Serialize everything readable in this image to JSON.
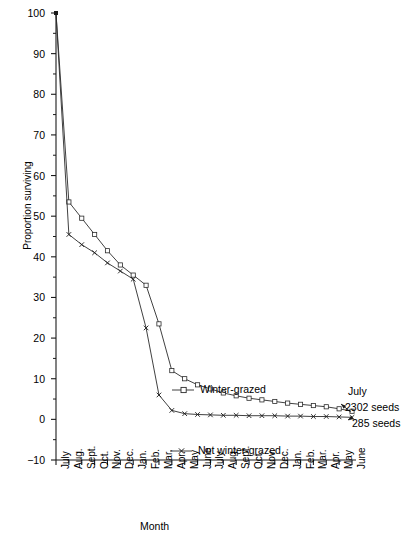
{
  "chart_data": {
    "type": "line",
    "title": "",
    "xlabel": "Month",
    "ylabel": "Proportion surviving",
    "ylim": [
      -10,
      100
    ],
    "yticks": [
      100,
      90,
      80,
      70,
      60,
      50,
      40,
      30,
      20,
      10,
      0,
      -10
    ],
    "yminor_step": 5,
    "grid": false,
    "legend_position": "inside-right",
    "categories": [
      "July",
      "Aug.",
      "Sept.",
      "Oct.",
      "Nov.",
      "Dec.",
      "Jan.",
      "Feb.",
      "Mar.",
      "Apr.",
      "May",
      "June",
      "July",
      "Aug.",
      "Sept.",
      "Oct.",
      "Nov.",
      "Dec.",
      "Jan.",
      "Feb.",
      "Mar.",
      "Apr.",
      "May",
      "June"
    ],
    "series": [
      {
        "name": "Winter-grazed",
        "marker": "open-square",
        "values": [
          100,
          53.5,
          49.5,
          45.5,
          41.5,
          38,
          35.5,
          33,
          23.5,
          12,
          10,
          8.5,
          7.5,
          6.5,
          5.8,
          5.2,
          4.8,
          4.4,
          4.0,
          3.7,
          3.4,
          3.1,
          2.6,
          2.0
        ]
      },
      {
        "name": "Not winter-grazed",
        "marker": "cross",
        "values": [
          100,
          45.5,
          43,
          41,
          38.5,
          36.5,
          34.5,
          22.5,
          6,
          2.2,
          1.4,
          1.2,
          1.1,
          1.0,
          1.0,
          0.9,
          0.9,
          0.9,
          0.8,
          0.8,
          0.7,
          0.7,
          0.6,
          0.5
        ]
      }
    ],
    "annotation": {
      "line1": "July",
      "line2": "2302 seeds",
      "line3": "285 seeds"
    }
  },
  "legend": {
    "winter_grazed": "Winter-grazed",
    "not_winter_grazed": "Not winter-grazed"
  }
}
